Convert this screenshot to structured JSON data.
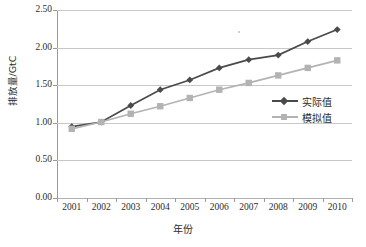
{
  "chart_data": {
    "type": "line",
    "title": "",
    "xlabel": "年份",
    "ylabel": "排放量/GtC",
    "categories": [
      "2001",
      "2002",
      "2003",
      "2004",
      "2005",
      "2006",
      "2007",
      "2008",
      "2009",
      "2010"
    ],
    "ylim": [
      0.0,
      2.5
    ],
    "yticks": [
      "0.00",
      "0.50",
      "1.00",
      "1.50",
      "2.00",
      "2.50"
    ],
    "ytick_values": [
      0.0,
      0.5,
      1.0,
      1.5,
      2.0,
      2.5
    ],
    "grid": true,
    "legend_position": "center-right",
    "series": [
      {
        "name": "实际值",
        "color": "#4a4a4a",
        "marker": "diamond",
        "values": [
          0.95,
          1.01,
          1.23,
          1.44,
          1.57,
          1.73,
          1.84,
          1.9,
          2.08,
          2.24
        ]
      },
      {
        "name": "模拟值",
        "color": "#b3b3b3",
        "marker": "square",
        "values": [
          0.92,
          1.01,
          1.12,
          1.22,
          1.33,
          1.44,
          1.53,
          1.63,
          1.73,
          1.83
        ]
      }
    ]
  },
  "legend": {
    "items": [
      {
        "label": "实际值"
      },
      {
        "label": "模拟值"
      }
    ]
  },
  "axes": {
    "x_title": "年份",
    "y_title": "排放量/GtC"
  }
}
